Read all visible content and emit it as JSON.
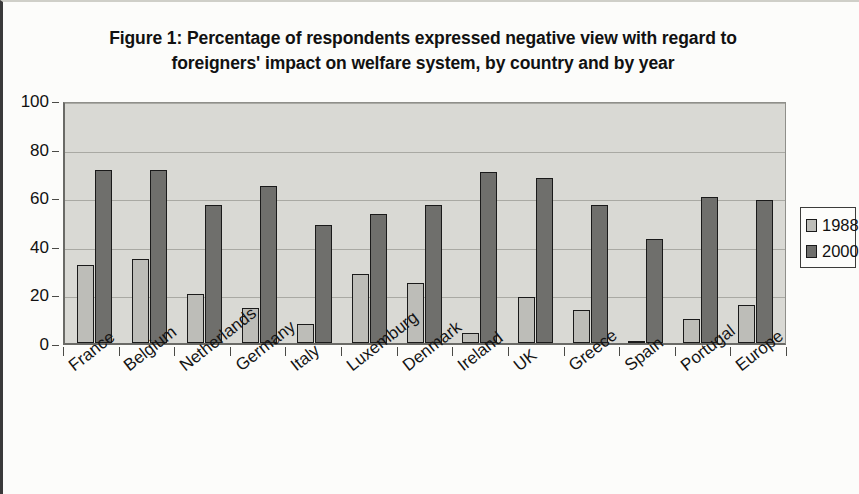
{
  "chart_data": {
    "type": "bar",
    "title": "Figure 1: Percentage of respondents expressed negative view with regard to foreigners' impact on welfare system, by country and by year",
    "title_line1": "Figure 1: Percentage of respondents expressed negative view with regard to",
    "title_line2": "foreigners' impact on welfare system, by country and by year",
    "xlabel": "",
    "ylabel": "",
    "ylim": [
      0,
      100
    ],
    "ytick_labels": [
      "0",
      "20",
      "40",
      "60",
      "80",
      "100"
    ],
    "ytick_values": [
      0,
      20,
      40,
      60,
      80,
      100
    ],
    "grid": true,
    "legend_position": "right",
    "categories": [
      "France",
      "Belgium",
      "Netherlands",
      "Germany",
      "Italy",
      "Luxemburg",
      "Denmark",
      "Ireland",
      "UK",
      "Greece",
      "Spain",
      "Portugal",
      "Europe"
    ],
    "series": [
      {
        "name": "1988",
        "color": "#bdbdb8",
        "values": [
          32,
          34.5,
          20,
          14.5,
          8,
          28.5,
          24.5,
          4,
          19,
          13.5,
          1,
          10,
          15.5
        ]
      },
      {
        "name": "2000",
        "color": "#6f6f6c",
        "values": [
          71,
          71,
          57,
          64.5,
          48.5,
          53,
          57,
          70.5,
          68,
          57,
          43,
          60,
          59
        ]
      }
    ]
  },
  "legend": {
    "entries": [
      {
        "label": "1988",
        "swatch": "light-gray-swatch"
      },
      {
        "label": "2000",
        "swatch": "dark-gray-swatch"
      }
    ]
  }
}
